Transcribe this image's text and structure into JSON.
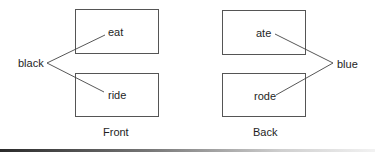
{
  "diagram": {
    "panels": [
      {
        "caption": "Front",
        "boxes": [
          {
            "word": "eat"
          },
          {
            "word": "ride"
          }
        ],
        "connector_label": "black"
      },
      {
        "caption": "Back",
        "boxes": [
          {
            "word": "ate"
          },
          {
            "word": "rode"
          }
        ],
        "connector_label": "blue"
      }
    ],
    "colors": {
      "line": "#444444",
      "box_border": "#555555",
      "text": "#1e1e1e"
    }
  }
}
